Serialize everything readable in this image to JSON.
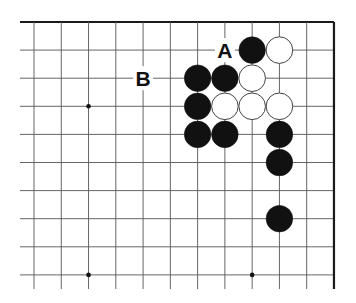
{
  "diagram": {
    "type": "go-board-fragment",
    "columns": 12,
    "rows": 10,
    "origin_x": 34,
    "origin_y": 22,
    "spacing_x": 27.27,
    "spacing_y": 28.1,
    "edges": [
      "top",
      "right"
    ],
    "colors": {
      "line": "#555555",
      "edge": "#1a1a1a",
      "black": "#111111",
      "white": "#ffffff",
      "white_stroke": "#444444"
    },
    "star_points": [
      {
        "col": 2,
        "row": 3
      },
      {
        "col": 2,
        "row": 9
      },
      {
        "col": 8,
        "row": 9
      }
    ],
    "stones": [
      {
        "color": "black",
        "col": 8,
        "row": 1
      },
      {
        "color": "white",
        "col": 9,
        "row": 1
      },
      {
        "color": "black",
        "col": 6,
        "row": 2
      },
      {
        "color": "black",
        "col": 7,
        "row": 2
      },
      {
        "color": "white",
        "col": 8,
        "row": 2
      },
      {
        "color": "black",
        "col": 6,
        "row": 3
      },
      {
        "color": "white",
        "col": 7,
        "row": 3
      },
      {
        "color": "white",
        "col": 8,
        "row": 3
      },
      {
        "color": "white",
        "col": 9,
        "row": 3
      },
      {
        "color": "black",
        "col": 6,
        "row": 4
      },
      {
        "color": "black",
        "col": 7,
        "row": 4
      },
      {
        "color": "black",
        "col": 9,
        "row": 4
      },
      {
        "color": "black",
        "col": 9,
        "row": 5
      },
      {
        "color": "black",
        "col": 9,
        "row": 7
      }
    ],
    "labels": [
      {
        "text": "A",
        "col": 7,
        "row": 1
      },
      {
        "text": "B",
        "col": 4,
        "row": 2
      }
    ]
  }
}
